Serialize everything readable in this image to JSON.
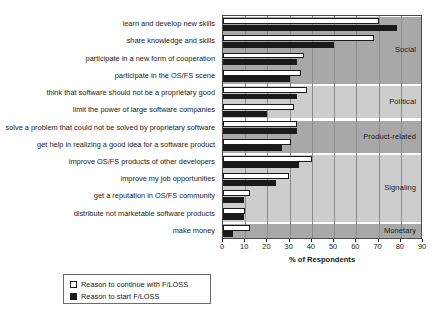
{
  "chart_data": {
    "type": "bar",
    "orientation": "horizontal",
    "title": "",
    "xlabel": "% of Respondents",
    "ylabel": "",
    "xlim": [
      0,
      90
    ],
    "xticks": [
      0,
      10,
      20,
      30,
      40,
      50,
      60,
      70,
      80,
      90
    ],
    "grid": true,
    "legend_position": "below-left",
    "categories": [
      "learn and develop new skills",
      "share knowledge and skills",
      "participate in a new form of cooperation",
      "participate in the OS/FS scene",
      "think that software should not be a proprietary good",
      "limit the power of large software companies",
      "solve a problem that could not be solved by proprietary software",
      "get help in realizing a good idea for a software product",
      "improve OS/FS products of other developers",
      "improve my job opportunities",
      "get a reputation in OS/FS community",
      "distribute not marketable software products",
      "make money"
    ],
    "series": [
      {
        "name": "Reason to continue with F/LOSS",
        "color": "#ffffff",
        "values": [
          70.0,
          68.0,
          36.5,
          35.0,
          38.0,
          32.0,
          33.5,
          30.5,
          40.0,
          29.5,
          12.0,
          10.0,
          12.0
        ]
      },
      {
        "name": "Reason to start F/LOSS",
        "color": "#1a1a1a",
        "values": [
          78.5,
          50.0,
          33.5,
          30.0,
          33.5,
          20.0,
          33.5,
          26.5,
          34.0,
          24.0,
          9.5,
          9.5,
          4.5
        ]
      }
    ],
    "group_bands": [
      {
        "label": "Social",
        "start_index": 0,
        "end_index": 3,
        "shade": "#a8a8a8"
      },
      {
        "label": "Political",
        "start_index": 4,
        "end_index": 5,
        "shade": "#cdcdcd"
      },
      {
        "label": "Product-related",
        "start_index": 6,
        "end_index": 7,
        "shade": "#a8a8a8"
      },
      {
        "label": "Signaling",
        "start_index": 8,
        "end_index": 11,
        "shade": "#cdcdcd"
      },
      {
        "label": "Monetary",
        "start_index": 12,
        "end_index": 12,
        "shade": "#a8a8a8"
      }
    ]
  }
}
